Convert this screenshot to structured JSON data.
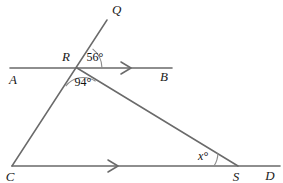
{
  "figure": {
    "type": "geometry-diagram",
    "background_color": "#ffffff",
    "line_color": "#6a6a6a",
    "arc_color": "#7a7a7a",
    "label_color": "#1a1a1a"
  },
  "points": {
    "Q": {
      "label": "Q",
      "x": 107,
      "y": 20,
      "label_x": 112,
      "label_y": 14
    },
    "R": {
      "label": "R",
      "x": 77,
      "y": 68,
      "label_x": 66,
      "label_y": 61
    },
    "A": {
      "label": "A",
      "x": 10,
      "y": 68,
      "label_x": 13,
      "label_y": 84
    },
    "B": {
      "label": "B",
      "x": 172,
      "y": 68,
      "label_x": 164,
      "label_y": 81
    },
    "C": {
      "label": "C",
      "x": 12,
      "y": 166,
      "label_x": 8,
      "label_y": 181
    },
    "S": {
      "label": "S",
      "x": 238,
      "y": 166,
      "label_x": 234,
      "label_y": 181
    },
    "D": {
      "label": "D",
      "x": 280,
      "y": 166,
      "label_x": 268,
      "label_y": 180
    }
  },
  "segments": [
    {
      "name": "line-AB",
      "from": "A",
      "to": "B"
    },
    {
      "name": "line-CD",
      "from": "C",
      "to": "D"
    },
    {
      "name": "line-QC",
      "from": "Q",
      "to": "C"
    },
    {
      "name": "line-RS",
      "from": "R",
      "to": "S"
    }
  ],
  "arrow_markers": [
    {
      "name": "arrow-on-AB",
      "x": 128,
      "y": 68,
      "direction": "right"
    },
    {
      "name": "arrow-on-CD",
      "x": 115,
      "y": 166,
      "direction": "right"
    }
  ],
  "angles": [
    {
      "name": "angle-QRB",
      "vertex": "R",
      "value": "56°",
      "label_x": 95,
      "label_y": 61,
      "arc_radius": 25
    },
    {
      "name": "angle-CRS",
      "vertex": "R",
      "value": "94°",
      "label_x": 83,
      "label_y": 86,
      "arc_radius": 22
    },
    {
      "name": "angle-RSC",
      "vertex": "S",
      "value": "x°",
      "label_x": 203,
      "label_y": 160,
      "arc_radius": 24
    }
  ]
}
